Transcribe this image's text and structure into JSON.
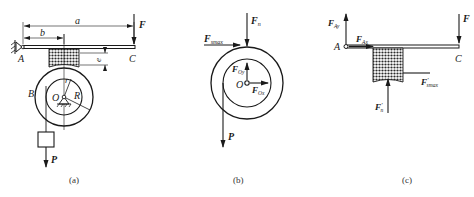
{
  "figure": {
    "panels": [
      {
        "id": "a",
        "caption": "(a)",
        "labels": {
          "A": "A",
          "B": "B",
          "C": "C",
          "O": "O",
          "r": "r",
          "R": "R",
          "a": "a",
          "b": "b",
          "e": "e",
          "F": "F",
          "P": "P"
        }
      },
      {
        "id": "b",
        "caption": "(b)",
        "labels": {
          "Fn_main": "F",
          "Fn_sub": "n",
          "Fsmax_main": "F",
          "Fsmax_sub": "smax",
          "FOy_main": "F",
          "FOy_sub": "Oy",
          "FOx_main": "F",
          "FOx_sub": "Ox",
          "O": "O",
          "P": "P"
        }
      },
      {
        "id": "c",
        "caption": "(c)",
        "labels": {
          "FAy_main": "F",
          "FAy_sub": "Ay",
          "FAx_main": "F",
          "FAx_sub": "Ax",
          "A": "A",
          "C": "C",
          "F": "F",
          "Fsmax_main": "F",
          "Fsmax_prime": "′",
          "Fsmax_sub": "smax",
          "Fn_main": "F",
          "Fn_prime": "′",
          "Fn_sub": "n"
        }
      }
    ],
    "colors": {
      "ink": "#1a1a1a",
      "background": "#ffffff"
    }
  }
}
